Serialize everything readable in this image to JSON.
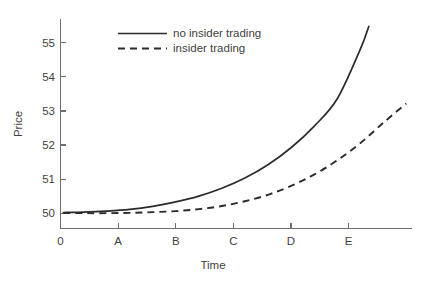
{
  "chart_data": {
    "type": "line",
    "title": "",
    "xlabel": "Time",
    "ylabel": "Price",
    "grid": false,
    "legend_position": "top-center",
    "x_tick_labels": [
      "0",
      "A",
      "B",
      "C",
      "D",
      "E"
    ],
    "x_tick_values": [
      0,
      1,
      2,
      3,
      4,
      5
    ],
    "y_tick_labels": [
      "50",
      "51",
      "52",
      "53",
      "54",
      "55"
    ],
    "y_tick_values": [
      50,
      51,
      52,
      53,
      54,
      55
    ],
    "xlim": [
      0,
      6.1
    ],
    "ylim": [
      49.55,
      55.7
    ],
    "series": [
      {
        "name": "no insider trading",
        "style": "solid",
        "color": "#2b2b2b",
        "x": [
          0.05,
          0.4,
          0.8,
          1.2,
          1.6,
          2.0,
          2.4,
          2.8,
          3.2,
          3.6,
          4.0,
          4.4,
          4.8,
          5.2,
          5.35
        ],
        "values": [
          50.02,
          50.03,
          50.06,
          50.11,
          50.2,
          50.33,
          50.5,
          50.73,
          51.03,
          51.42,
          51.92,
          52.55,
          53.35,
          54.8,
          55.48
        ]
      },
      {
        "name": "insider trading",
        "style": "dashed",
        "color": "#2b2b2b",
        "x": [
          0.05,
          0.4,
          0.8,
          1.2,
          1.6,
          2.0,
          2.4,
          2.8,
          3.2,
          3.6,
          4.0,
          4.4,
          4.8,
          5.2,
          5.6,
          6.0
        ],
        "values": [
          50.0,
          50.0,
          50.0,
          50.01,
          50.03,
          50.06,
          50.12,
          50.21,
          50.35,
          50.54,
          50.8,
          51.13,
          51.55,
          52.05,
          52.65,
          53.22
        ]
      }
    ]
  },
  "legend": {
    "entries": [
      {
        "label": "no insider trading",
        "style": "solid"
      },
      {
        "label": "insider trading",
        "style": "dashed"
      }
    ]
  },
  "axes": {
    "y_title": "Price",
    "x_title": "Time"
  }
}
